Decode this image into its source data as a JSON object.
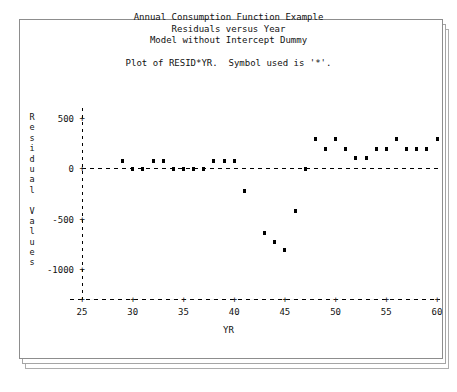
{
  "titles": {
    "line1": "Annual Consumption Function Example",
    "line2": "Residuals versus Year",
    "line3": "Model without Intercept Dummy"
  },
  "subtitle": "Plot of RESID*YR.  Symbol used is '*'.",
  "axes": {
    "y_title_chars": [
      "R",
      "e",
      "s",
      "i",
      "d",
      "u",
      "a",
      "l",
      "",
      "V",
      "a",
      "l",
      "u",
      "e",
      "s"
    ],
    "y_title_text": "Residual Values",
    "x_title": "YR",
    "y_ticks": [
      "500",
      "0",
      "-500",
      "-1000"
    ],
    "x_ticks": [
      "25",
      "30",
      "35",
      "40",
      "45",
      "50",
      "55",
      "60"
    ],
    "tick_glyph": "+"
  },
  "chart_data": {
    "type": "scatter",
    "subtitle": "Plot of RESID*YR.  Symbol used is '*'.",
    "xlabel": "YR",
    "ylabel": "Residual Values",
    "xlim": [
      25,
      60
    ],
    "ylim": [
      -1125,
      600
    ],
    "xticks": [
      25,
      30,
      35,
      40,
      45,
      50,
      55,
      60
    ],
    "yticks": [
      500,
      0,
      -500,
      -1000
    ],
    "grid": false,
    "legend": false,
    "reference_line_y": 0,
    "symbol": "*",
    "points": [
      {
        "x": 29,
        "y": 75
      },
      {
        "x": 30,
        "y": 0
      },
      {
        "x": 31,
        "y": -8
      },
      {
        "x": 32,
        "y": 75
      },
      {
        "x": 33,
        "y": 75
      },
      {
        "x": 34,
        "y": 0
      },
      {
        "x": 35,
        "y": -8
      },
      {
        "x": 36,
        "y": 0
      },
      {
        "x": 37,
        "y": -8
      },
      {
        "x": 38,
        "y": 75
      },
      {
        "x": 39,
        "y": 75
      },
      {
        "x": 40,
        "y": 75
      },
      {
        "x": 41,
        "y": -225
      },
      {
        "x": 43,
        "y": -640
      },
      {
        "x": 44,
        "y": -730
      },
      {
        "x": 45,
        "y": -805
      },
      {
        "x": 46,
        "y": -425
      },
      {
        "x": 47,
        "y": 0
      },
      {
        "x": 48,
        "y": 290
      },
      {
        "x": 49,
        "y": 195
      },
      {
        "x": 50,
        "y": 290
      },
      {
        "x": 51,
        "y": 195
      },
      {
        "x": 52,
        "y": 100
      },
      {
        "x": 53,
        "y": 100
      },
      {
        "x": 54,
        "y": 195
      },
      {
        "x": 55,
        "y": 195
      },
      {
        "x": 56,
        "y": 290
      },
      {
        "x": 57,
        "y": 195
      },
      {
        "x": 58,
        "y": 195
      },
      {
        "x": 59,
        "y": 195
      },
      {
        "x": 60,
        "y": 290
      }
    ]
  },
  "colors": {
    "ink": "#111111",
    "point": "#000000",
    "frame": "#8d8d8d",
    "page": "#ffffff"
  }
}
